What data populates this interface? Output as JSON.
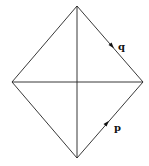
{
  "diagram": {
    "type": "rhombus-with-diagonals",
    "vertices": {
      "top": [
        77,
        6
      ],
      "left": [
        12,
        82
      ],
      "right": [
        143,
        82
      ],
      "bottom": [
        77,
        158
      ]
    },
    "edges": [
      {
        "name": "top-left",
        "from": "top",
        "to": "left"
      },
      {
        "name": "top-right",
        "from": "top",
        "to": "right"
      },
      {
        "name": "bottom-left",
        "from": "bottom",
        "to": "left"
      },
      {
        "name": "bottom-right",
        "from": "bottom",
        "to": "right"
      },
      {
        "name": "vertical-diagonal",
        "from": "top",
        "to": "bottom"
      },
      {
        "name": "horizontal-diagonal",
        "from": "left",
        "to": "right"
      }
    ],
    "arrows": [
      {
        "label": "q",
        "edge": "top-right",
        "direction": "down-right",
        "position": [
          112,
          46
        ],
        "label_position": [
          118,
          50
        ]
      },
      {
        "label": "p",
        "edge": "bottom-right",
        "direction": "up-right",
        "position": [
          107,
          123
        ],
        "label_position": [
          114,
          130
        ]
      }
    ],
    "colors": {
      "line": "#222222",
      "background": "#ffffff"
    }
  }
}
